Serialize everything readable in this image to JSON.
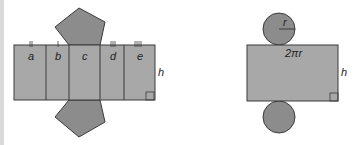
{
  "colors": {
    "face": "#a8a8a8",
    "base": "#8c8c8c",
    "stroke": "#3a3a3a",
    "edge_bar": "#d9d9d9"
  },
  "prism_net": {
    "face_labels": [
      "a",
      "b",
      "c",
      "d",
      "e"
    ],
    "height_label": "h"
  },
  "cylinder_net": {
    "radius_label": "r",
    "circumference_label": "2πr",
    "height_label": "h"
  }
}
